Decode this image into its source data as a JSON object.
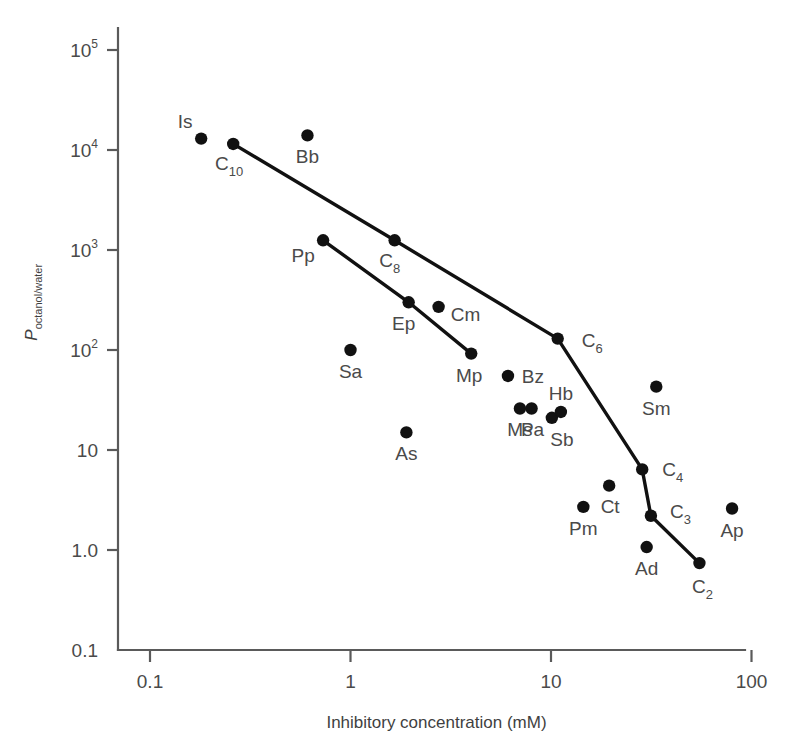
{
  "chart_data": {
    "type": "scatter",
    "title": "",
    "xlabel": "Inhibitory concentration (mM)",
    "ylabel": "P_octanol/water",
    "ylabel_main": "P",
    "ylabel_sub": "octanol/water",
    "xscale": "log",
    "yscale": "log",
    "xlim": [
      0.1,
      100
    ],
    "ylim": [
      0.1,
      100000
    ],
    "grid": false,
    "legend": null,
    "xticks": [
      {
        "value": 0.1,
        "label": "0.1"
      },
      {
        "value": 1,
        "label": "1"
      },
      {
        "value": 10,
        "label": "10"
      },
      {
        "value": 100,
        "label": "100"
      }
    ],
    "yticks": [
      {
        "value": 100000,
        "mantissa": "10",
        "exponent": "5",
        "label": "10^5"
      },
      {
        "value": 10000,
        "mantissa": "10",
        "exponent": "4",
        "label": "10^4"
      },
      {
        "value": 1000,
        "mantissa": "10",
        "exponent": "3",
        "label": "10^3"
      },
      {
        "value": 100,
        "mantissa": "10",
        "exponent": "2",
        "label": "10^2"
      },
      {
        "value": 10,
        "mantissa": "10",
        "exponent": "",
        "label": "10"
      },
      {
        "value": 1,
        "mantissa": "1.0",
        "exponent": "",
        "label": "1.0"
      },
      {
        "value": 0.1,
        "mantissa": "0.1",
        "exponent": "",
        "label": "0.1"
      }
    ],
    "points": [
      {
        "id": "Is",
        "label": "Is",
        "sub": "",
        "x": 0.18,
        "y": 13000,
        "label_dx": -16,
        "label_dy": -11,
        "anchor": "middle"
      },
      {
        "id": "C10",
        "label": "C",
        "sub": "10",
        "x": 0.26,
        "y": 11500,
        "label_dx": -4,
        "label_dy": 26,
        "anchor": "middle"
      },
      {
        "id": "Bb",
        "label": "Bb",
        "sub": "",
        "x": 0.61,
        "y": 14000,
        "label_dx": 0,
        "label_dy": 28,
        "anchor": "middle"
      },
      {
        "id": "Pp",
        "label": "Pp",
        "sub": "",
        "x": 0.73,
        "y": 1250,
        "label_dx": -20,
        "label_dy": 22,
        "anchor": "middle"
      },
      {
        "id": "C8",
        "label": "C",
        "sub": "8",
        "x": 1.66,
        "y": 1250,
        "label_dx": -5,
        "label_dy": 27,
        "anchor": "middle"
      },
      {
        "id": "Sa",
        "label": "Sa",
        "sub": "",
        "x": 1.0,
        "y": 100,
        "label_dx": 0,
        "label_dy": 28,
        "anchor": "middle"
      },
      {
        "id": "Ep",
        "label": "Ep",
        "sub": "",
        "x": 1.95,
        "y": 300,
        "label_dx": -5,
        "label_dy": 28,
        "anchor": "middle"
      },
      {
        "id": "Cm",
        "label": "Cm",
        "sub": "",
        "x": 2.75,
        "y": 270,
        "label_dx": 27,
        "label_dy": 14,
        "anchor": "middle"
      },
      {
        "id": "Mp",
        "label": "Mp",
        "sub": "",
        "x": 4.0,
        "y": 92,
        "label_dx": -2,
        "label_dy": 28,
        "anchor": "middle"
      },
      {
        "id": "As",
        "label": "As",
        "sub": "",
        "x": 1.9,
        "y": 15,
        "label_dx": 0,
        "label_dy": 28,
        "anchor": "middle"
      },
      {
        "id": "Bz",
        "label": "Bz",
        "sub": "",
        "x": 6.1,
        "y": 55,
        "label_dx": 25,
        "label_dy": 7,
        "anchor": "middle"
      },
      {
        "id": "Ms",
        "label": "Ms",
        "sub": "",
        "x": 7.0,
        "y": 26,
        "label_dx": 0,
        "label_dy": 27,
        "anchor": "middle"
      },
      {
        "id": "Pa",
        "label": "Pa",
        "sub": "",
        "x": 8.0,
        "y": 26,
        "label_dx": 1,
        "label_dy": 27,
        "anchor": "middle"
      },
      {
        "id": "Sb",
        "label": "Sb",
        "sub": "",
        "x": 10.1,
        "y": 21,
        "label_dx": 10,
        "label_dy": 28,
        "anchor": "middle"
      },
      {
        "id": "Hb",
        "label": "Hb",
        "sub": "",
        "x": 11.2,
        "y": 24,
        "label_dx": 0,
        "label_dy": -12,
        "anchor": "middle"
      },
      {
        "id": "C6",
        "label": "C",
        "sub": "6",
        "x": 10.8,
        "y": 130,
        "label_dx": 24,
        "label_dy": 8,
        "anchor": "start"
      },
      {
        "id": "Sm",
        "label": "Sm",
        "sub": "",
        "x": 33.5,
        "y": 43,
        "label_dx": 0,
        "label_dy": 28,
        "anchor": "middle"
      },
      {
        "id": "Ct",
        "label": "Ct",
        "sub": "",
        "x": 19.5,
        "y": 4.4,
        "label_dx": 1,
        "label_dy": 27,
        "anchor": "middle"
      },
      {
        "id": "Pm",
        "label": "Pm",
        "sub": "",
        "x": 14.5,
        "y": 2.7,
        "label_dx": 0,
        "label_dy": 28,
        "anchor": "middle"
      },
      {
        "id": "C4",
        "label": "C",
        "sub": "4",
        "x": 28.5,
        "y": 6.4,
        "label_dx": 20,
        "label_dy": 7,
        "anchor": "start"
      },
      {
        "id": "C3",
        "label": "C",
        "sub": "3",
        "x": 31.5,
        "y": 2.2,
        "label_dx": 19,
        "label_dy": 2,
        "anchor": "start"
      },
      {
        "id": "Ad",
        "label": "Ad",
        "sub": "",
        "x": 30.0,
        "y": 1.07,
        "label_dx": 0,
        "label_dy": 28,
        "anchor": "middle"
      },
      {
        "id": "Ap",
        "label": "Ap",
        "sub": "",
        "x": 80.0,
        "y": 2.6,
        "label_dx": 0,
        "label_dy": 28,
        "anchor": "middle"
      },
      {
        "id": "C2",
        "label": "C",
        "sub": "2",
        "x": 55.0,
        "y": 0.74,
        "label_dx": 3,
        "label_dy": 30,
        "anchor": "middle"
      }
    ],
    "series": [
      {
        "name": "n-alkanol series (C10-C8-C6-C4-C3-C2)",
        "color": "#111111",
        "path": [
          "C10",
          "C8",
          "C6",
          "C4",
          "C3",
          "C2"
        ]
      },
      {
        "name": "Pp-Ep-Mp series",
        "color": "#111111",
        "path": [
          "Pp",
          "Ep",
          "Mp"
        ]
      }
    ]
  }
}
